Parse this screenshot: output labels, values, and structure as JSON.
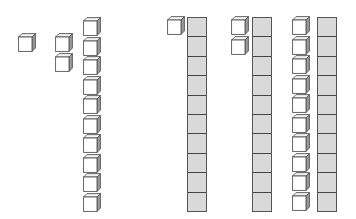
{
  "diagram": {
    "type": "base-ten-blocks",
    "colors": {
      "cube_face": "#ffffff",
      "cube_side": "#9a9a9a",
      "cube_top": "#f2f2f2",
      "outline": "#555555",
      "rod_fill": "#d9d9d9"
    },
    "groups": [
      {
        "id": "one",
        "tens": 0,
        "ones": 1,
        "value": 1
      },
      {
        "id": "two",
        "tens": 0,
        "ones": 2,
        "value": 2
      },
      {
        "id": "ten-units",
        "tens": 0,
        "ones": 10,
        "value": 10
      },
      {
        "id": "eleven",
        "tens": 1,
        "ones": 1,
        "value": 11
      },
      {
        "id": "twelve",
        "tens": 1,
        "ones": 2,
        "value": 12
      },
      {
        "id": "twenty",
        "tens": 1,
        "ones": 10,
        "value": 20
      }
    ],
    "rod_segments": 10
  }
}
